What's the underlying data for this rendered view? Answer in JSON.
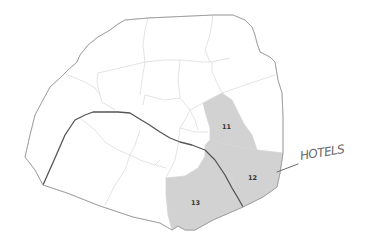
{
  "map": {
    "subject": "Paris arrondissements",
    "highlighted_districts": [
      {
        "id": "11",
        "label": "11"
      },
      {
        "id": "12",
        "label": "12"
      },
      {
        "id": "13",
        "label": "13"
      }
    ],
    "annotation": {
      "text": "HOTELS",
      "style": "handwritten",
      "points_to": "12"
    },
    "colors": {
      "highlight_fill": "#d2d2d2",
      "district_fill": "#ffffff",
      "boundary": "#d6d6d6",
      "outer_boundary": "#9a9a9a",
      "river": "#555555",
      "annotation": "#6a6a6a"
    }
  }
}
